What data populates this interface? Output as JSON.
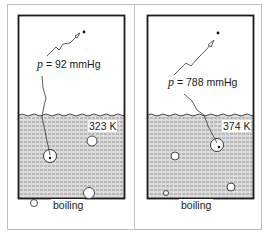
{
  "figure": {
    "panels": [
      {
        "id": "left",
        "pressure_symbol": "p",
        "pressure_equals": "=",
        "pressure_value": "92 mmHg",
        "temperature": "323 K",
        "state_label": "boiling"
      },
      {
        "id": "right",
        "pressure_symbol": "p",
        "pressure_equals": "=",
        "pressure_value": "788 mmHg",
        "temperature": "374 K",
        "state_label": "boiling"
      }
    ],
    "colors": {
      "container_border": "#1a1a1a",
      "liquid_fill": "#d9d9d9",
      "liquid_hatch": "#8a8a8a",
      "frame": "#bdbdbd"
    }
  }
}
